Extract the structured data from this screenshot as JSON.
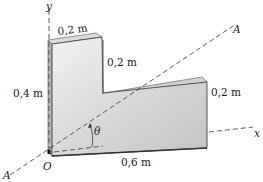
{
  "diagram": {
    "type": "L-shaped plate with inclined axis",
    "labels": {
      "y_axis": "y",
      "x_axis": "x",
      "origin": "O",
      "axis_A_top": "A",
      "axis_A_bottom": "A",
      "angle": "θ",
      "top_width": "0,2 m",
      "step_height": "0,2 m",
      "left_height": "0,4 m",
      "right_height": "0,2 m",
      "bottom_length": "0,6 m"
    },
    "colors": {
      "face_light": "#e4e4e4",
      "face_mid": "#cfcfcf",
      "edge_dark": "#444444",
      "side_face": "#b9b9b9",
      "dash": "#333333"
    }
  }
}
